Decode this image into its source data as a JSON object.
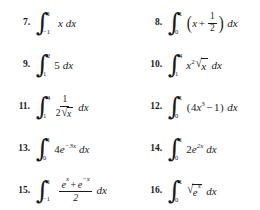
{
  "document": {
    "type": "math-exercise-list",
    "background_color": "#ffffff",
    "text_color": "#1a1a1a",
    "columns": 2,
    "rows": 5
  },
  "problems": [
    {
      "number": "7.",
      "column": 1,
      "row": 1,
      "lower_limit": "−1",
      "upper_limit": "1",
      "integrand_text": "x",
      "differential": "dx",
      "latex": "\\int_{-1}^{1} x \\, dx"
    },
    {
      "number": "8.",
      "column": 2,
      "row": 1,
      "lower_limit": "0",
      "upper_limit": "1",
      "integrand_text": "(x + 1/2)",
      "numerator": "1",
      "denominator": "2",
      "operator": "+",
      "variable": "x",
      "differential": "dx",
      "latex": "\\int_{0}^{1} \\left(x + \\frac{1}{2}\\right) dx"
    },
    {
      "number": "9.",
      "column": 1,
      "row": 2,
      "lower_limit": "1",
      "upper_limit": "2",
      "integrand_text": "5",
      "differential": "dx",
      "latex": "\\int_{1}^{2} 5 \\, dx"
    },
    {
      "number": "10.",
      "column": 2,
      "row": 2,
      "lower_limit": "1",
      "upper_limit": "4",
      "integrand_text": "x^2 sqrt(x)",
      "base": "x",
      "exponent": "2",
      "radicand": "x",
      "differential": "dx",
      "latex": "\\int_{1}^{4} x^{2}\\sqrt{x}\\, dx"
    },
    {
      "number": "11.",
      "column": 1,
      "row": 3,
      "lower_limit": "1",
      "upper_limit": "4",
      "integrand_text": "1 / (2 sqrt(x))",
      "numerator": "1",
      "denominator_coefficient": "2",
      "denominator_radicand": "x",
      "differential": "dx",
      "latex": "\\int_{1}^{4} \\frac{1}{2\\sqrt{x}}\\, dx"
    },
    {
      "number": "12.",
      "column": 2,
      "row": 3,
      "lower_limit": "0",
      "upper_limit": "1",
      "integrand_text": "(4x^3 − 1)",
      "coefficient": "4",
      "base": "x",
      "exponent": "3",
      "operator": "−",
      "constant": "1",
      "differential": "dx",
      "latex": "\\int_{0}^{1} (4x^{3} - 1)\\, dx"
    },
    {
      "number": "13.",
      "column": 1,
      "row": 4,
      "lower_limit": "0",
      "upper_limit": "1",
      "integrand_text": "4e^(−3x)",
      "coefficient": "4",
      "base": "e",
      "exponent": "−3x",
      "differential": "dx",
      "latex": "\\int_{0}^{1} 4e^{-3x}\\, dx"
    },
    {
      "number": "14.",
      "column": 2,
      "row": 4,
      "lower_limit": "0",
      "upper_limit": "1",
      "integrand_text": "2e^(2x)",
      "coefficient": "2",
      "base": "e",
      "exponent": "2x",
      "differential": "dx",
      "latex": "\\int_{0}^{1} 2e^{2x}\\, dx"
    },
    {
      "number": "15.",
      "column": 1,
      "row": 5,
      "lower_limit": "−1",
      "upper_limit": "1",
      "integrand_text": "(e^x + e^(−x)) / 2",
      "numerator_first_base": "e",
      "numerator_first_exponent": "x",
      "numerator_operator": "+",
      "numerator_second_base": "e",
      "numerator_second_exponent": "−x",
      "denominator": "2",
      "differential": "dx",
      "latex": "\\int_{-1}^{1} \\frac{e^{x}+e^{-x}}{2}\\, dx"
    },
    {
      "number": "16.",
      "column": 2,
      "row": 5,
      "lower_limit": "0",
      "upper_limit": "1",
      "integrand_text": "sqrt(e^x)",
      "radicand_base": "e",
      "radicand_exponent": "x",
      "differential": "dx",
      "latex": "\\int_{0}^{1} \\sqrt{e^{x}}\\, dx"
    }
  ],
  "symbols": {
    "integral_sign": "∫",
    "radical_sign": "√",
    "left_paren": "(",
    "right_paren": ")",
    "plus": "+",
    "minus": "−",
    "differential_x": "dx"
  }
}
